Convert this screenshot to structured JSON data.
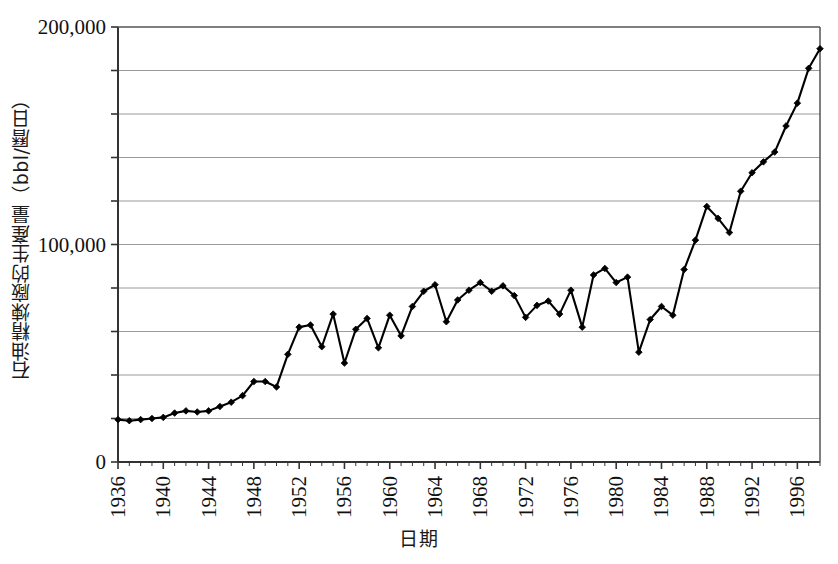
{
  "chart_data": {
    "type": "line",
    "title": "",
    "subtitle": "",
    "xlabel": "日期",
    "ylabel": "石油精煉廠的生產量（bbl/曆日）",
    "legend": [],
    "legend_position": "none",
    "grid": true,
    "grid_axis": "y",
    "xlim": [
      1936,
      1998
    ],
    "ylim": [
      0,
      200000
    ],
    "y_ticks_major": [
      0,
      100000,
      200000
    ],
    "y_tick_labels": [
      "0",
      "100,000",
      "200,000"
    ],
    "y_gridline_values": [
      20000,
      40000,
      60000,
      80000,
      100000,
      120000,
      140000,
      160000,
      180000,
      200000
    ],
    "x_tick_labels": [
      "1936",
      "1940",
      "1944",
      "1948",
      "1952",
      "1956",
      "1960",
      "1964",
      "1968",
      "1972",
      "1976",
      "1980",
      "1984",
      "1988",
      "1992",
      "1996"
    ],
    "x_tick_values": [
      1936,
      1940,
      1944,
      1948,
      1952,
      1956,
      1960,
      1964,
      1968,
      1972,
      1976,
      1980,
      1984,
      1988,
      1992,
      1996
    ],
    "marker": "diamond",
    "line_color": "#000000",
    "marker_color": "#000000",
    "x": [
      1936,
      1937,
      1938,
      1939,
      1940,
      1941,
      1942,
      1943,
      1944,
      1945,
      1946,
      1947,
      1948,
      1949,
      1950,
      1951,
      1952,
      1953,
      1954,
      1955,
      1956,
      1957,
      1958,
      1959,
      1960,
      1961,
      1962,
      1963,
      1964,
      1965,
      1966,
      1967,
      1968,
      1969,
      1970,
      1971,
      1972,
      1973,
      1974,
      1975,
      1976,
      1977,
      1978,
      1979,
      1980,
      1981,
      1982,
      1983,
      1984,
      1985,
      1986,
      1987,
      1988,
      1989,
      1990,
      1991,
      1992,
      1993,
      1994,
      1995,
      1996,
      1997,
      1998
    ],
    "values": [
      19500,
      19000,
      19500,
      20000,
      20500,
      22500,
      23500,
      23000,
      23500,
      25500,
      27500,
      30500,
      37000,
      37000,
      34500,
      49500,
      62000,
      63000,
      53000,
      68000,
      45500,
      61000,
      66000,
      52500,
      67500,
      58000,
      71500,
      78500,
      81500,
      64500,
      74500,
      79000,
      82500,
      78500,
      81000,
      76500,
      66500,
      72000,
      74000,
      68000,
      79000,
      62000,
      86000,
      89000,
      82500,
      85000,
      50500,
      65500,
      71500,
      67500,
      88500,
      102000,
      117500,
      112000,
      105500,
      124500,
      133000,
      138000,
      142500,
      154500,
      165000,
      181000,
      190000
    ],
    "series_name": "石油精煉廠的生產量"
  },
  "axes": {
    "y_axis_name": "production-axis",
    "x_axis_name": "date-axis"
  }
}
